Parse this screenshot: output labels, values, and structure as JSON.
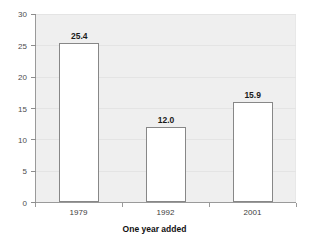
{
  "chart_data": {
    "type": "bar",
    "title": "",
    "subtitle": "",
    "xlabel": "One year added",
    "ylabel": "",
    "categories": [
      "1979",
      "1992",
      "2001"
    ],
    "values": [
      25.4,
      12.0,
      15.9
    ],
    "data_labels": [
      "25.4",
      "12.0",
      "15.9"
    ],
    "ylim": [
      0,
      30
    ],
    "ytick_values": [
      0,
      5,
      10,
      15,
      20,
      25,
      30
    ],
    "ytick_labels": [
      "0",
      "5",
      "10",
      "15",
      "20",
      "25",
      "30"
    ],
    "grid": true,
    "legend": "none",
    "series": [
      {
        "name": "One year added",
        "values": [
          25.4,
          12.0,
          15.9
        ]
      }
    ],
    "colors": {
      "bar_fill": "#ffffff",
      "bar_border": "#878787",
      "plot_background": "#efefef",
      "axis": "#9a9a9a",
      "gridline": "#e4e4e4",
      "label_text": "#1a1a1a",
      "tick_text": "#4d4d4d"
    }
  }
}
